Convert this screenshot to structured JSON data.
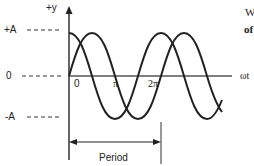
{
  "diagram": {
    "y_axis_label": "+y",
    "x_axis_label": "ωt",
    "amplitude_labels": {
      "positive": "+A",
      "zero": "0",
      "negative": "-A"
    },
    "x_ticks": [
      "0",
      "π",
      "2π"
    ],
    "period_label": "Period",
    "side_text": {
      "line1": "W",
      "line2": "of"
    },
    "colors": {
      "stroke": "#222222",
      "axis": "#333333",
      "background": "#ffffff"
    }
  }
}
